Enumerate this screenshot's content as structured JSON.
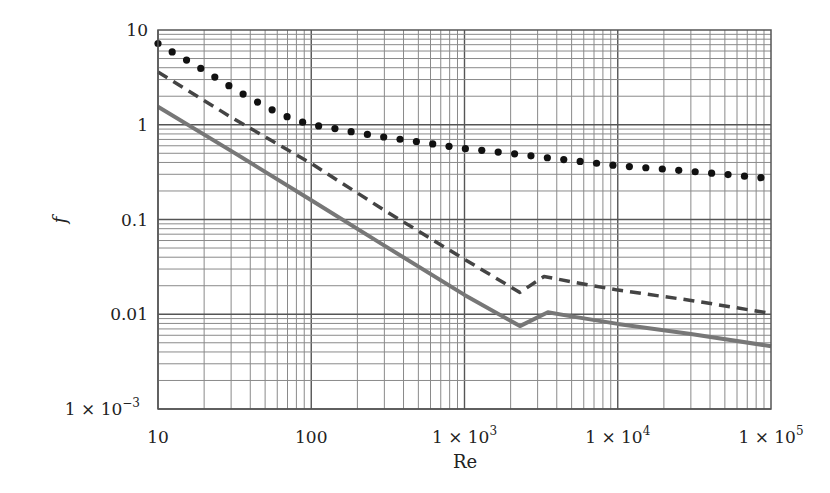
{
  "chart_data": {
    "type": "line",
    "title": "",
    "xlabel": "Re",
    "ylabel": "f",
    "xscale": "log",
    "yscale": "log",
    "xlim": [
      10,
      100000
    ],
    "ylim": [
      0.001,
      10
    ],
    "grid": true,
    "legend": null,
    "x_ticks": [
      {
        "value": 10,
        "label": "10"
      },
      {
        "value": 100,
        "label": "100"
      },
      {
        "value": 1000,
        "label": "1 × 10",
        "exp": "3"
      },
      {
        "value": 10000,
        "label": "1 × 10",
        "exp": "4"
      },
      {
        "value": 100000,
        "label": "1 × 10",
        "exp": "5"
      }
    ],
    "y_ticks": [
      {
        "value": 10,
        "label": "10"
      },
      {
        "value": 1,
        "label": "1"
      },
      {
        "value": 0.1,
        "label": "0.1"
      },
      {
        "value": 0.01,
        "label": "0.01"
      },
      {
        "value": 0.001,
        "label": "1 × 10",
        "exp": "−3"
      }
    ],
    "series": [
      {
        "name": "dotted",
        "style": "dotted",
        "color": "#111111",
        "x": [
          10,
          13,
          17,
          22,
          30,
          40,
          55,
          75,
          100,
          150,
          200,
          300,
          500,
          700,
          1000,
          2000,
          3000,
          5000,
          10000,
          20000,
          50000,
          100000
        ],
        "values": [
          7.2,
          5.6,
          4.4,
          3.4,
          2.5,
          1.9,
          1.45,
          1.15,
          1.0,
          0.9,
          0.82,
          0.74,
          0.66,
          0.61,
          0.56,
          0.5,
          0.46,
          0.42,
          0.37,
          0.34,
          0.3,
          0.27
        ]
      },
      {
        "name": "dashed",
        "style": "dashed",
        "color": "#444444",
        "x": [
          10,
          30,
          100,
          300,
          1000,
          2300,
          3300,
          5000,
          10000,
          30000,
          100000
        ],
        "values": [
          3.6,
          1.2,
          0.39,
          0.125,
          0.038,
          0.017,
          0.025,
          0.022,
          0.018,
          0.014,
          0.0102
        ]
      },
      {
        "name": "solid",
        "style": "solid",
        "color": "#777777",
        "x": [
          10,
          30,
          100,
          300,
          1000,
          2300,
          3500,
          5000,
          10000,
          30000,
          100000
        ],
        "values": [
          1.55,
          0.53,
          0.16,
          0.053,
          0.016,
          0.0075,
          0.0105,
          0.0095,
          0.0079,
          0.0062,
          0.0046
        ]
      }
    ]
  }
}
